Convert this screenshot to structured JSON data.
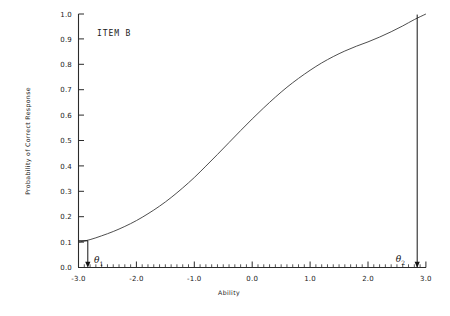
{
  "figure": {
    "item_label": "ITEM B",
    "background": "#ffffff",
    "line_color": "#3a3a3a",
    "text_color": "#1a1a1a"
  },
  "axes": {
    "xlabel": "Ability",
    "ylabel": "Probability of Correct Response",
    "x_ticks": [
      "-3.0",
      "-2.0",
      "-1.0",
      "0.0",
      "1.0",
      "2.0",
      "3.0"
    ],
    "y_ticks": [
      "0.0",
      "0.1",
      "0.2",
      "0.3",
      "0.4",
      "0.5",
      "0.6",
      "0.7",
      "0.8",
      "0.9",
      "1.0"
    ]
  },
  "annotations": {
    "theta1": {
      "symbol": "θ",
      "subscript": "1",
      "x": -2.85,
      "p": 0.105
    },
    "theta2": {
      "symbol": "θ",
      "subscript": "2",
      "x": 2.85,
      "p": 1.0
    }
  },
  "chart_data": {
    "type": "line",
    "title": "ITEM B",
    "xlabel": "Ability",
    "ylabel": "Probability of Correct Response",
    "xlim": [
      -3.0,
      3.0
    ],
    "ylim": [
      0.0,
      1.0
    ],
    "xticks": [
      -3.0,
      -2.0,
      -1.0,
      0.0,
      1.0,
      2.0,
      3.0
    ],
    "yticks": [
      0.0,
      0.1,
      0.2,
      0.3,
      0.4,
      0.5,
      0.6,
      0.7,
      0.8,
      0.9,
      1.0
    ],
    "x_minor_tick_step": 0.1,
    "grid": false,
    "legend": null,
    "model": "2PL item characteristic curve",
    "parameters": {
      "difficulty_b": -0.1,
      "discrimination_a": 1.1
    },
    "series": [
      {
        "name": "ITEM B ICC",
        "x": [
          -3.0,
          -2.8,
          -2.6,
          -2.4,
          -2.2,
          -2.0,
          -1.8,
          -1.6,
          -1.4,
          -1.2,
          -1.0,
          -0.8,
          -0.6,
          -0.4,
          -0.2,
          0.0,
          0.2,
          0.4,
          0.6,
          0.8,
          1.0,
          1.2,
          1.4,
          1.6,
          1.8,
          2.0,
          2.2,
          2.4,
          2.6,
          2.8,
          3.0
        ],
        "y": [
          0.1,
          0.11,
          0.125,
          0.142,
          0.162,
          0.185,
          0.212,
          0.242,
          0.276,
          0.314,
          0.355,
          0.4,
          0.446,
          0.493,
          0.54,
          0.586,
          0.63,
          0.672,
          0.711,
          0.746,
          0.778,
          0.807,
          0.832,
          0.854,
          0.873,
          0.89,
          0.909,
          0.93,
          0.953,
          0.978,
          1.0
        ]
      }
    ],
    "annotations": [
      {
        "label": "θ₁",
        "x": -2.85,
        "y": 0.105,
        "note": "arrow from curve down to ability axis"
      },
      {
        "label": "θ₂",
        "x": 2.85,
        "y": 1.0,
        "note": "vertical line from ability axis up to P = 1.0"
      }
    ]
  }
}
